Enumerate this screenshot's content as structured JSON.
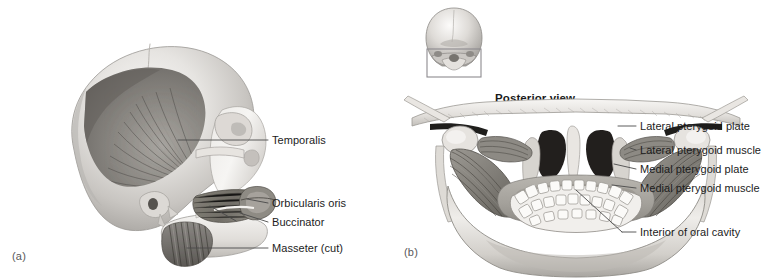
{
  "figure": {
    "kind": "anatomical-illustration",
    "background_color": "#ffffff",
    "text_color": "#1c1c1c",
    "leader_color": "#4a4a4a",
    "bone_light": "#f2f1ef",
    "bone_mid": "#c9c7c4",
    "bone_shadow": "#8e8c89",
    "muscle_light": "#b4b1ad",
    "muscle_mid": "#8a8782",
    "muscle_dark": "#5d5b57",
    "cavity_dark": "#2a2a28"
  },
  "panels": [
    {
      "id": "a",
      "marker": "(a)",
      "view_title": "",
      "art_name": "lateral-skull-with-chewing-muscles",
      "callouts": [
        {
          "id": "temporalis",
          "label": "Temporalis"
        },
        {
          "id": "orbicularis-oris",
          "label": "Orbicularis oris"
        },
        {
          "id": "buccinator",
          "label": "Buccinator"
        },
        {
          "id": "masseter-cut",
          "label": "Masseter (cut)"
        }
      ]
    },
    {
      "id": "b",
      "marker": "(b)",
      "view_title": "Posterior view",
      "art_name": "posterior-skull-with-pterygoid-muscles",
      "orientation_thumbnail": {
        "name": "posterior-skull-orientation-thumbnail",
        "highlight_box": true
      },
      "callouts": [
        {
          "id": "lateral-pterygoid-plate",
          "label": "Lateral pterygoid plate"
        },
        {
          "id": "lateral-pterygoid-muscle",
          "label": "Lateral pterygoid muscle"
        },
        {
          "id": "medial-pterygoid-plate",
          "label": "Medial pterygoid plate"
        },
        {
          "id": "medial-pterygoid-muscle",
          "label": "Medial pterygoid muscle"
        },
        {
          "id": "interior-of-oral-cavity",
          "label": "Interior of oral cavity"
        }
      ]
    }
  ]
}
